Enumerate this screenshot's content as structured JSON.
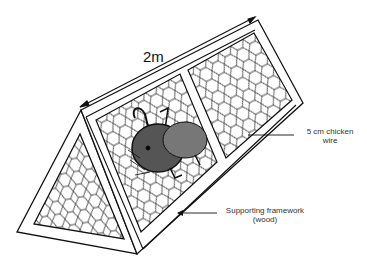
{
  "diagram": {
    "dimension_label": "2m",
    "labels": {
      "wire_line1": "5 cm chicken",
      "wire_line2": "wire",
      "frame_line1": "Supporting framework",
      "frame_line2": "(wood)"
    },
    "colors": {
      "line": "#111111",
      "background": "#ffffff",
      "text": "#333333"
    }
  }
}
